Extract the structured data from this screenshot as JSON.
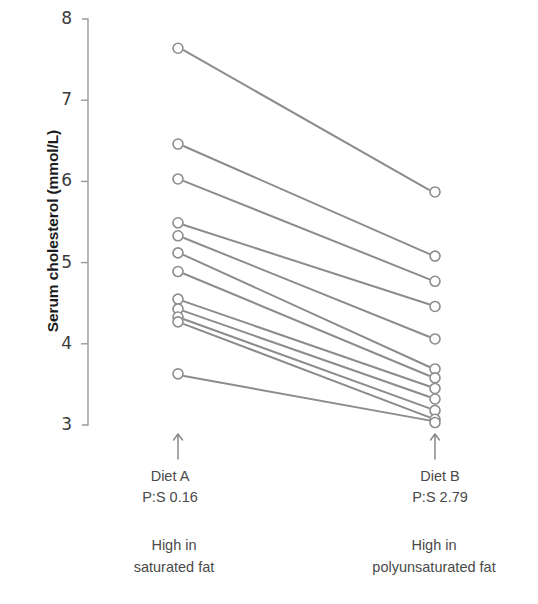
{
  "chart_data": {
    "type": "line",
    "title": "",
    "subtitle": "",
    "xlabel": "",
    "ylabel": "Serum cholesterol (mmol/L)",
    "ylim": [
      3,
      8
    ],
    "yticks": [
      3,
      4,
      5,
      6,
      7,
      8
    ],
    "ytick_labels": [
      "3",
      "4",
      "5",
      "6",
      "7",
      "8"
    ],
    "grid": false,
    "legend": "none",
    "categories": [
      "Diet A",
      "Diet B"
    ],
    "x_group_labels": [
      {
        "name": "Diet A",
        "ratio": "P:S 0.16",
        "caption_line1": "High in",
        "caption_line2": "saturated fat"
      },
      {
        "name": "Diet B",
        "ratio": "P:S 2.79",
        "caption_line1": "High in",
        "caption_line2": "polyunsaturated fat"
      }
    ],
    "series": [
      {
        "name": "Subject 1",
        "values": [
          7.64,
          5.87
        ]
      },
      {
        "name": "Subject 2",
        "values": [
          6.46,
          5.08
        ]
      },
      {
        "name": "Subject 3",
        "values": [
          6.03,
          4.77
        ]
      },
      {
        "name": "Subject 4",
        "values": [
          5.49,
          4.46
        ]
      },
      {
        "name": "Subject 5",
        "values": [
          5.33,
          4.06
        ]
      },
      {
        "name": "Subject 6",
        "values": [
          5.12,
          3.69
        ]
      },
      {
        "name": "Subject 7",
        "values": [
          4.89,
          3.58
        ]
      },
      {
        "name": "Subject 8",
        "values": [
          4.55,
          3.45
        ]
      },
      {
        "name": "Subject 9",
        "values": [
          4.43,
          3.32
        ]
      },
      {
        "name": "Subject 10",
        "values": [
          4.33,
          3.18
        ]
      },
      {
        "name": "Subject 11",
        "values": [
          4.27,
          3.07
        ]
      },
      {
        "name": "Subject 12",
        "values": [
          3.63,
          3.03
        ]
      }
    ],
    "marker": "open-circle",
    "line_color": "#8c8c8c",
    "marker_color": "#8c8c8c",
    "axis_color": "#9a9a9a",
    "text_color": "#4a4a4a"
  },
  "axis": {
    "y_title": "Serum cholesterol (mmol/L)"
  },
  "annotations": {
    "arrow_left": "up-arrow",
    "arrow_right": "up-arrow"
  }
}
